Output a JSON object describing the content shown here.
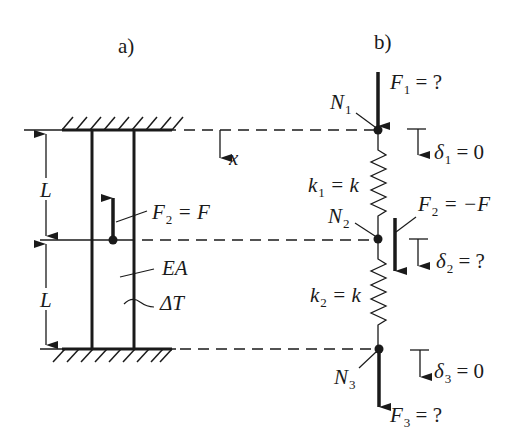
{
  "panels": {
    "a": {
      "label": "a)"
    },
    "b": {
      "label": "b)"
    }
  },
  "panel_a": {
    "length_top": "L",
    "length_bottom": "L",
    "load": {
      "symbol": "F",
      "sub": "2",
      "rhs": "= F"
    },
    "stiffness": "EA",
    "temperature": "ΔT",
    "axis": "x"
  },
  "panel_b": {
    "nodes": [
      {
        "symbol": "N",
        "sub": "1"
      },
      {
        "symbol": "N",
        "sub": "2"
      },
      {
        "symbol": "N",
        "sub": "3"
      }
    ],
    "forces": [
      {
        "symbol": "F",
        "sub": "1",
        "rhs": "= ?"
      },
      {
        "symbol": "F",
        "sub": "2",
        "rhs": "= −F"
      },
      {
        "symbol": "F",
        "sub": "3",
        "rhs": "= ?"
      }
    ],
    "displacements": [
      {
        "symbol": "δ",
        "sub": "1",
        "rhs": "= 0"
      },
      {
        "symbol": "δ",
        "sub": "2",
        "rhs": "= ?"
      },
      {
        "symbol": "δ",
        "sub": "3",
        "rhs": "= 0"
      }
    ],
    "springs": [
      {
        "symbol": "k",
        "sub": "1",
        "rhs": "= k"
      },
      {
        "symbol": "k",
        "sub": "2",
        "rhs": "= k"
      }
    ]
  },
  "colors": {
    "ink": "#1a1a1a",
    "background": "#ffffff"
  }
}
